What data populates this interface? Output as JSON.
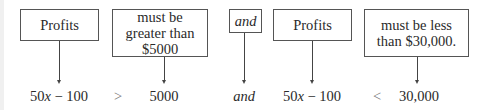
{
  "diagram": {
    "boxes": [
      {
        "id": "profits-1",
        "text": "Profits"
      },
      {
        "id": "greater",
        "text": "must be greater than $5000"
      },
      {
        "id": "and-box",
        "text": "and"
      },
      {
        "id": "profits-2",
        "text": "Profits"
      },
      {
        "id": "less",
        "text": "must be less than $30,000."
      }
    ],
    "expression": {
      "left_1": {
        "coef": "50",
        "var": "x",
        "rest": " − 100"
      },
      "op_1": ">",
      "value_1": "5000",
      "conjunction": "and",
      "left_2": {
        "coef": "50",
        "var": "x",
        "rest": " − 100"
      },
      "op_2": "<",
      "value_2": "30,000"
    }
  }
}
